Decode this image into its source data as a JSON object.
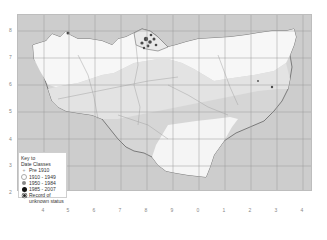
{
  "map": {
    "type": "distribution-map",
    "region_fill": {
      "sea": "#cdcdcd",
      "land_white": "#f7f7f7",
      "land_light": "#e3e3e3",
      "land_mid": "#d6d6d6",
      "coast_line": "#555555",
      "grid_line": "#9a9a9a",
      "river_line": "#a8a8a8",
      "records_dark": "#444444"
    },
    "y_ticks": [
      "8",
      "7",
      "6",
      "5",
      "4",
      "3",
      "2"
    ],
    "x_ticks": [
      "4",
      "5",
      "6",
      "7",
      "8",
      "9",
      "0",
      "1",
      "2",
      "3",
      "4"
    ]
  },
  "legend": {
    "title_line1": "Key to",
    "title_line2": "Date Classes",
    "items": [
      {
        "symbol": "small-cross",
        "label": "Pre 1910"
      },
      {
        "symbol": "open-circle",
        "label": "1910 - 1949"
      },
      {
        "symbol": "grey-circle",
        "label": "1950 - 1984"
      },
      {
        "symbol": "black-circle",
        "label": "1985 - 2007"
      },
      {
        "symbol": "star-dot",
        "label": "Record of"
      }
    ],
    "item_continuation": "unknown status"
  }
}
